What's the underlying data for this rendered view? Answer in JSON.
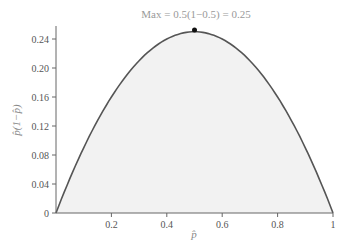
{
  "chart_data": {
    "type": "area",
    "title": "",
    "annotation": "Max = 0.5(1−0.5) = 0.25",
    "xlabel": "p̂",
    "ylabel": "p̂(1−p̂)",
    "xlim": [
      0,
      1
    ],
    "ylim": [
      0,
      0.25
    ],
    "x_ticks": [
      "0.2",
      "0.4",
      "0.6",
      "0.8",
      "1"
    ],
    "y_ticks": [
      "0",
      "0.04",
      "0.08",
      "0.12",
      "0.16",
      "0.20",
      "0.24"
    ],
    "series": [
      {
        "name": "p̂(1−p̂)",
        "function": "x*(1-x)",
        "x": [
          0,
          0.1,
          0.2,
          0.3,
          0.4,
          0.5,
          0.6,
          0.7,
          0.8,
          0.9,
          1.0
        ],
        "values": [
          0,
          0.09,
          0.16,
          0.21,
          0.24,
          0.25,
          0.24,
          0.21,
          0.16,
          0.09,
          0
        ]
      }
    ],
    "max_point": {
      "x": 0.5,
      "y": 0.25
    },
    "grid": false,
    "fill_color": "#f0f0f0",
    "line_color": "#555555"
  }
}
